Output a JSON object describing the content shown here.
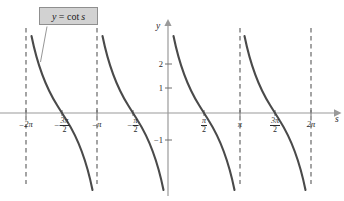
{
  "figure": {
    "title_label": "y = cot s",
    "label_parts": {
      "lhs": "y",
      "operator": "=",
      "function": "cot",
      "argument": "s"
    },
    "axis_names": {
      "x": "s",
      "y": "y"
    }
  },
  "chart_data": {
    "type": "line",
    "title": "y = cot s",
    "xlabel": "s",
    "ylabel": "y",
    "function": "cot",
    "xlim": [
      -7.3,
      7.6
    ],
    "ylim": [
      -2.4,
      2.9
    ],
    "grid": false,
    "legend": null,
    "x_tick_labels": [
      "-2π",
      "-3π/2",
      "-π",
      "-π/2",
      "π/2",
      "π",
      "3π/2",
      "2π"
    ],
    "x_tick_values": [
      -6.2832,
      -4.7124,
      -3.1416,
      -1.5708,
      1.5708,
      3.1416,
      4.7124,
      6.2832
    ],
    "y_tick_labels": [
      "2",
      "1",
      "-1"
    ],
    "y_tick_values": [
      2,
      1,
      -1
    ],
    "asymptotes": {
      "values": [
        -6.2832,
        -3.1416,
        0,
        3.1416,
        6.2832
      ],
      "labels": [
        "-2π",
        "-π",
        "0",
        "π",
        "2π"
      ],
      "style": "dashed"
    },
    "zero_crossings": [
      -4.7124,
      -1.5708,
      1.5708,
      4.7124
    ],
    "branches": [
      {
        "domain": [
          -6.2832,
          -3.1416
        ],
        "zero_at": -4.7124
      },
      {
        "domain": [
          -3.1416,
          0
        ],
        "zero_at": -1.5708
      },
      {
        "domain": [
          0,
          3.1416
        ],
        "zero_at": 1.5708
      },
      {
        "domain": [
          3.1416,
          6.2832
        ],
        "zero_at": 4.7124
      }
    ],
    "annotation": {
      "text": "y = cot s",
      "points_to_branch": 0
    }
  },
  "x_ticks": [
    {
      "id": "neg-2pi",
      "sign": "−",
      "mode": "plain",
      "value": "2π",
      "left": 26,
      "top": 120
    },
    {
      "id": "neg-3pi-2",
      "sign": "−",
      "mode": "frac",
      "num": "3π",
      "den": "2",
      "left": 62,
      "top": 117
    },
    {
      "id": "neg-pi",
      "sign": "−",
      "mode": "plain",
      "value": "π",
      "left": 97,
      "top": 120
    },
    {
      "id": "neg-pi-2",
      "sign": "−",
      "mode": "frac",
      "num": "π",
      "den": "2",
      "left": 133,
      "top": 117
    },
    {
      "id": "pi-2",
      "sign": "",
      "mode": "frac",
      "num": "π",
      "den": "2",
      "left": 204,
      "top": 117
    },
    {
      "id": "pi",
      "sign": "",
      "mode": "plain",
      "value": "π",
      "left": 240,
      "top": 120
    },
    {
      "id": "3pi-2",
      "sign": "",
      "mode": "frac",
      "num": "3π",
      "den": "2",
      "left": 275,
      "top": 117
    },
    {
      "id": "2pi",
      "sign": "",
      "mode": "plain",
      "value": "2π",
      "left": 311,
      "top": 120
    }
  ],
  "y_ticks": [
    {
      "id": "y-2",
      "text": "2",
      "left": 163,
      "top": 64
    },
    {
      "id": "y-1",
      "text": "1",
      "left": 163,
      "top": 88
    },
    {
      "id": "y-neg-1",
      "text": "−1",
      "left": 163,
      "top": 140
    }
  ]
}
